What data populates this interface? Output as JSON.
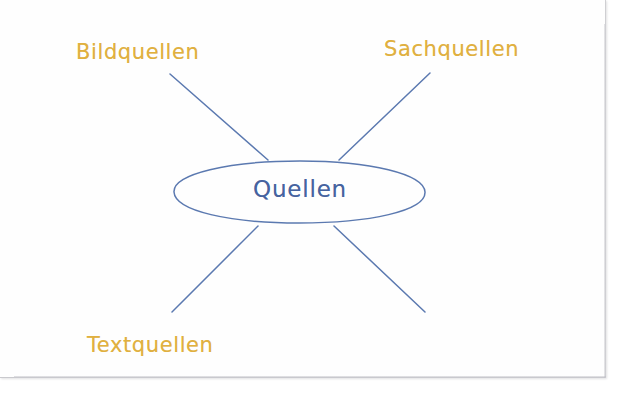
{
  "document": {
    "type": "handwritten-mind-map",
    "language": "de",
    "medium": "paper-worksheet"
  },
  "colors": {
    "branch_label": "#e0b040",
    "center_text": "#46639f",
    "ink_line": "#5b79b0",
    "ellipse_stroke": "#5b79b0",
    "paper": "#fefefe",
    "paper_edge": "#c9c9cd"
  },
  "mindmap": {
    "center": {
      "label": "Quellen",
      "shape": "ellipse"
    },
    "branches": [
      {
        "id": "top-left",
        "label": "Bildquellen",
        "filled": true,
        "line": {
          "x1": 170,
          "y1": 74,
          "x2": 268,
          "y2": 160
        }
      },
      {
        "id": "top-right",
        "label": "Sachquellen",
        "filled": true,
        "line": {
          "x1": 430,
          "y1": 73,
          "x2": 339,
          "y2": 160
        }
      },
      {
        "id": "bottom-left",
        "label": "Textquellen",
        "filled": true,
        "line": {
          "x1": 258,
          "y1": 226,
          "x2": 172,
          "y2": 312
        }
      },
      {
        "id": "bottom-right",
        "label": "",
        "filled": false,
        "line": {
          "x1": 334,
          "y1": 226,
          "x2": 425,
          "y2": 312
        }
      }
    ]
  },
  "labels": {
    "bildquellen": "Bildquellen",
    "sachquellen": "Sachquellen",
    "textquellen": "Textquellen",
    "center": "Quellen"
  }
}
